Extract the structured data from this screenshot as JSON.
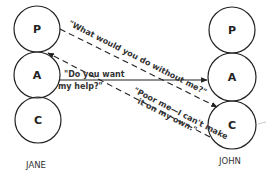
{
  "people": {
    "left": {
      "name": "JANE",
      "states": [
        {
          "letter": "P"
        },
        {
          "letter": "A"
        },
        {
          "letter": "C"
        }
      ]
    },
    "right": {
      "name": "JOHN",
      "states": [
        {
          "letter": "P"
        },
        {
          "letter": "A"
        },
        {
          "letter": "C"
        }
      ]
    }
  },
  "transactions": [
    {
      "id": "jane-a-to-john-a",
      "from": "JANE.A",
      "to": "JOHN.A",
      "style": "solid",
      "lines": [
        "\"Do you want",
        "my help?\""
      ]
    },
    {
      "id": "jane-p-to-john-c",
      "from": "JANE.P",
      "to": "JOHN.C",
      "style": "dashed",
      "lines": [
        "\"What would you do without me?\""
      ]
    },
    {
      "id": "john-c-to-jane-p",
      "from": "JOHN.C",
      "to": "JANE.P",
      "style": "dashed",
      "lines": [
        "\"Poor me—I can't make",
        "it on my own.\""
      ]
    }
  ],
  "colors": {
    "ink": "#222222",
    "background": "#ffffff"
  }
}
